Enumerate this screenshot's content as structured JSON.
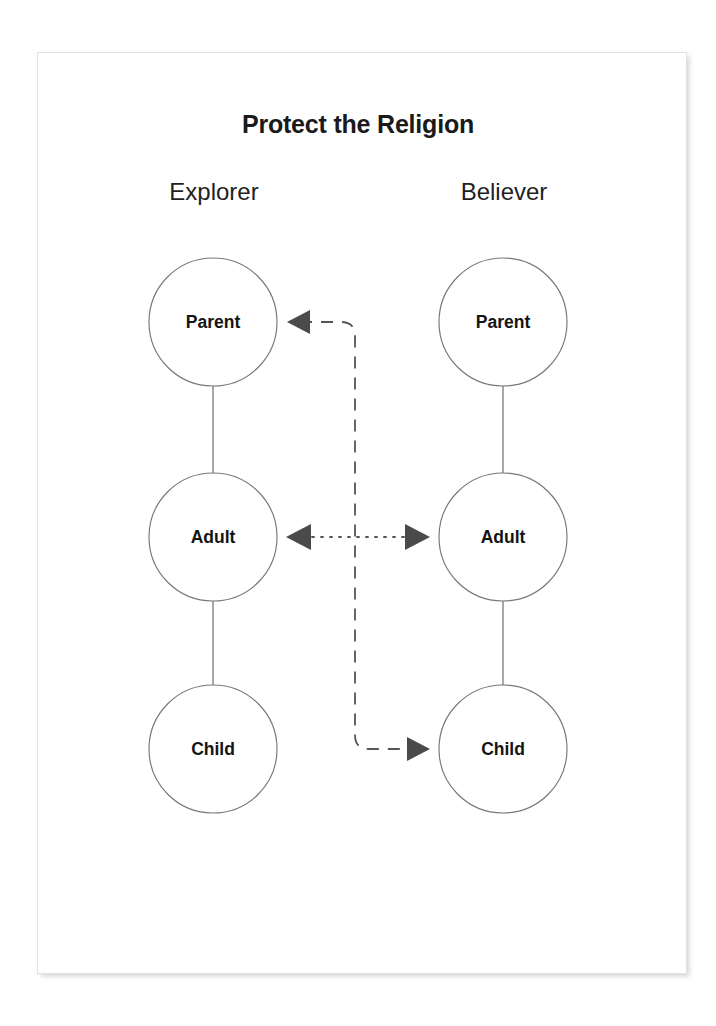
{
  "card": {
    "background_color": "#ffffff",
    "border_color": "#e2e2e2"
  },
  "diagram": {
    "title": "Protect the Religion",
    "type": "transactional-analysis-ego-state-diagram",
    "columns": [
      {
        "id": "explorer",
        "label": "Explorer"
      },
      {
        "id": "believer",
        "label": "Believer"
      }
    ],
    "rows": [
      {
        "id": "parent",
        "label": "Parent"
      },
      {
        "id": "adult",
        "label": "Adult"
      },
      {
        "id": "child",
        "label": "Child"
      }
    ],
    "nodes": [
      {
        "id": "explorer-parent",
        "column": "explorer",
        "row": "parent",
        "label": "Parent"
      },
      {
        "id": "explorer-adult",
        "column": "explorer",
        "row": "adult",
        "label": "Adult"
      },
      {
        "id": "explorer-child",
        "column": "explorer",
        "row": "child",
        "label": "Child"
      },
      {
        "id": "believer-parent",
        "column": "believer",
        "row": "parent",
        "label": "Parent"
      },
      {
        "id": "believer-adult",
        "column": "believer",
        "row": "adult",
        "label": "Adult"
      },
      {
        "id": "believer-child",
        "column": "believer",
        "row": "child",
        "label": "Child"
      }
    ],
    "connectors": [
      {
        "id": "explorer-spine",
        "style": "solid",
        "from": "explorer-parent",
        "to": "explorer-child",
        "arrows": "none"
      },
      {
        "id": "believer-spine",
        "style": "solid",
        "from": "believer-parent",
        "to": "believer-child",
        "arrows": "none"
      },
      {
        "id": "adult-adult-transaction",
        "style": "dotted",
        "from": "explorer-adult",
        "to": "believer-adult",
        "arrows": "both"
      },
      {
        "id": "crossed-transaction",
        "style": "dashed",
        "from": "believer-child",
        "to": "explorer-parent",
        "arrows": "both-ends"
      }
    ],
    "colors": {
      "node_stroke": "#777777",
      "node_fill": "#ffffff",
      "connector": "#555555",
      "arrow_fill": "#4a4a4a",
      "text": "#141414"
    }
  }
}
